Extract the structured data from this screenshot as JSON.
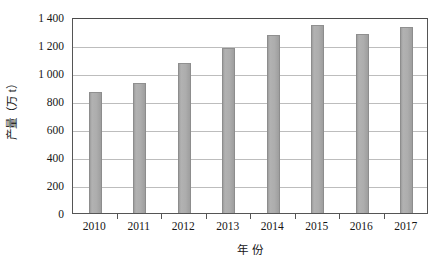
{
  "chart_data": {
    "type": "bar",
    "title": "",
    "xlabel": "年  份",
    "ylabel": "产量（万 t）",
    "categories": [
      "2010",
      "2011",
      "2012",
      "2013",
      "2014",
      "2015",
      "2016",
      "2017"
    ],
    "values": [
      865,
      930,
      1070,
      1180,
      1275,
      1340,
      1280,
      1330
    ],
    "ylim": [
      0,
      1400
    ],
    "ytick_values": [
      0,
      200,
      400,
      600,
      800,
      1000,
      1200,
      1400
    ],
    "ytick_labels": [
      "0",
      "200",
      "400",
      "600",
      "800",
      "1 000",
      "1 200",
      "1 400"
    ],
    "grid": "horizontal",
    "legend": "none",
    "bar_color": "#a9a9a9",
    "gridline_color": "#bdbdbd",
    "axis_color": "#555555",
    "background_color": "#ffffff"
  }
}
